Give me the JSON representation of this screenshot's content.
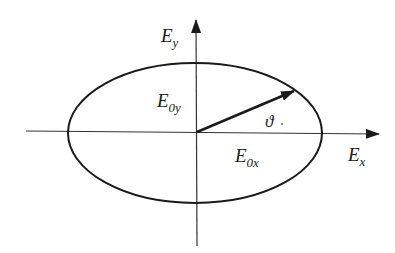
{
  "diagram": {
    "colors": {
      "stroke": "#1a1a1a",
      "axis": "#333333",
      "background": "#ffffff"
    },
    "axes": {
      "x_label": {
        "main": "E",
        "sub": "x"
      },
      "y_label": {
        "main": "E",
        "sub": "y"
      }
    },
    "ellipse": {
      "cx": 195,
      "cy": 133,
      "rx": 127,
      "ry": 70
    },
    "vector": {
      "from": [
        197,
        132
      ],
      "to": [
        294,
        91
      ]
    },
    "labels": {
      "amp_y": {
        "main": "E",
        "sub": "0y"
      },
      "amp_x": {
        "main": "E",
        "sub": "0x"
      },
      "angle": "ϑ"
    }
  }
}
